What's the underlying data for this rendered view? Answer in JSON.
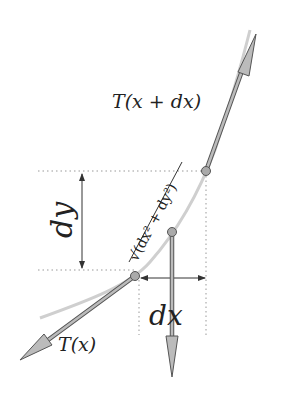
{
  "diagram": {
    "labels": {
      "upper_tension": "T(x + dx)",
      "lower_tension": "T(x)",
      "dy": "dy",
      "dx": "dx",
      "arc_length": "√(dx² + dy²)"
    },
    "colors": {
      "curve": "#c8c8c8",
      "arrow_fill": "#b8b8b8",
      "arrow_stroke": "#555555",
      "dimension": "#333333",
      "dotted": "#999999"
    }
  }
}
